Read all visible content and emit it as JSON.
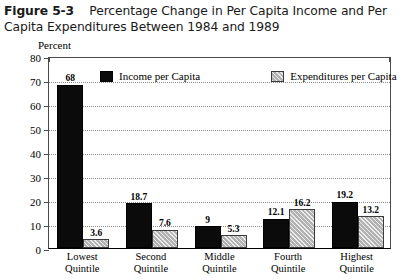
{
  "figure": {
    "number": "Figure 5-3",
    "title": "Percentage Change in Per Capita Income and Per Capita Expenditures Between 1984 and 1989"
  },
  "axis_unit_label": "Percent",
  "legend": {
    "items": [
      {
        "label": "Income per Capita",
        "swatch": "black-solid-swatch",
        "color": "#0b0b0b"
      },
      {
        "label": "Expenditures per Capita",
        "swatch": "gray-hatched-swatch",
        "color": "#b2b2b2"
      }
    ]
  },
  "chart_data": {
    "type": "bar",
    "title": "Percentage Change in Per Capita Income and Per Capita Expenditures Between 1984 and 1989",
    "xlabel": "",
    "ylabel": "Percent",
    "ylim": [
      0,
      80
    ],
    "yticks": [
      0,
      10,
      20,
      30,
      40,
      50,
      60,
      70,
      80
    ],
    "ytick_labels": [
      "0",
      "10",
      "20",
      "30",
      "40",
      "50",
      "60",
      "70",
      "80"
    ],
    "grid": "horizontal-dotted",
    "legend_position": "top-inside",
    "categories": [
      "Lowest Quintile",
      "Second Quintile",
      "Middle Quintile",
      "Fourth Quintile",
      "Highest Quintile"
    ],
    "category_lines": [
      [
        "Lowest",
        "Quintile"
      ],
      [
        "Second",
        "Quintile"
      ],
      [
        "Middle",
        "Quintile"
      ],
      [
        "Fourth",
        "Quintile"
      ],
      [
        "Highest",
        "Quintile"
      ]
    ],
    "series": [
      {
        "name": "Income per Capita",
        "values": [
          68,
          18.7,
          9,
          12.1,
          19.2
        ],
        "labels": [
          "68",
          "18.7",
          "9",
          "12.1",
          "19.2"
        ]
      },
      {
        "name": "Expenditures per Capita",
        "values": [
          3.6,
          7.6,
          5.3,
          16.2,
          13.2
        ],
        "labels": [
          "3.6",
          "7.6",
          "5.3",
          "16.2",
          "13.2"
        ]
      }
    ]
  }
}
